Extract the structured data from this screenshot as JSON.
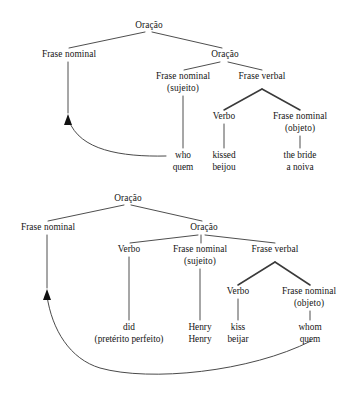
{
  "figure": {
    "kind": "syntax-tree-pair",
    "language_pair": "English / Portuguese",
    "background_color": "#ffffff",
    "line_color": "#3a3a3a",
    "text_color": "#141414"
  },
  "tree_top": {
    "name": "wh-subject-movement-tree",
    "nodes": {
      "root": "Oração",
      "left_np": "Frase nominal",
      "embedded_clause": "Oração",
      "subject_np": "Frase nominal",
      "subject_np_role": "(sujeito)",
      "vp": "Frase verbal",
      "verb": "Verbo",
      "object_np": "Frase nominal",
      "object_np_role": "(objeto)"
    },
    "terminals": [
      {
        "word": "who",
        "gloss": "quem"
      },
      {
        "word": "kissed",
        "gloss": "beijou"
      },
      {
        "word": "the bride",
        "gloss": "a noiva"
      }
    ]
  },
  "tree_bottom": {
    "name": "wh-object-movement-tree",
    "nodes": {
      "root": "Oração",
      "left_np": "Frase nominal",
      "embedded_clause": "Oração",
      "aux_verb": "Verbo",
      "subject_np": "Frase nominal",
      "subject_np_role": "(sujeito)",
      "vp": "Frase verbal",
      "verb": "Verbo",
      "object_np": "Frase nominal",
      "object_np_role": "(objeto)"
    },
    "terminals": [
      {
        "word": "did",
        "gloss": "(pretérito perfeito)"
      },
      {
        "word": "Henry",
        "gloss": "Henry"
      },
      {
        "word": "kiss",
        "gloss": "beijar"
      },
      {
        "word": "whom",
        "gloss": "quem"
      }
    ]
  }
}
